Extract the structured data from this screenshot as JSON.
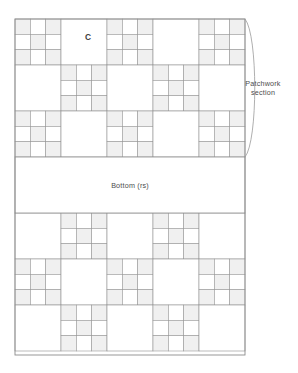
{
  "diagram": {
    "labels": {
      "block_letter": "C",
      "patchwork_section_line1": "Patchwork",
      "patchwork_section_line2": "section",
      "bottom": "Bottom (rs)"
    },
    "colors": {
      "patch_fill": "#f0f0f0",
      "patch_stroke": "#9a9a9a",
      "outline": "#8c8c8c",
      "plain_fill": "#ffffff",
      "text": "#4d4d4d",
      "bracket": "#9a9a9a",
      "background": "#ffffff"
    },
    "geometry": {
      "grid_left": 15,
      "grid_right": 245,
      "unit": 46,
      "columns": 5,
      "top_section_top": 19,
      "top_section_rows": 3,
      "bottom_band_top": 157,
      "bottom_band_height": 56,
      "lower_section_top": 213,
      "lower_section_rows": 3,
      "grid_bottom": 355
    },
    "structure": {
      "nine_patch_subdivisions": 3,
      "nine_patch_shading": "corners-and-center shaded, edges plain",
      "top_section_phase": "nine-patch at even column indices (0,2,4) in rows 0 and 2; odd indices (1,3) in row 1",
      "lower_section_phase": "nine-patch at odd column indices (1,3) in rows 0 and 2; even indices (0,2,4) in row 1"
    },
    "bracket": {
      "present": true,
      "side": "right",
      "spans": "patchwork section top to bottom",
      "label_lines": [
        "Patchwork",
        "section"
      ]
    }
  }
}
